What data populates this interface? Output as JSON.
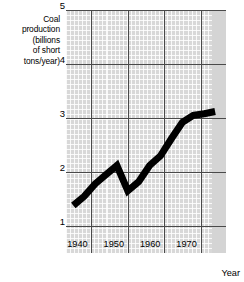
{
  "chart_data": {
    "type": "line",
    "title": "",
    "ylabel": "Coal production (billions of short tons/year)",
    "ylabel_lines": [
      "Coal",
      "production",
      "(billions",
      "of short",
      "tons/year)"
    ],
    "xlabel": "Year",
    "xlim": [
      1933,
      1977
    ],
    "ylim": [
      0.5,
      5.0
    ],
    "yticks": [
      5,
      4,
      3,
      2,
      1
    ],
    "ytick_labels": [
      "5",
      "4",
      "3",
      "2",
      "1"
    ],
    "xticks": [
      1940,
      1950,
      1960,
      1970
    ],
    "xtick_labels": [
      "1940",
      "1950",
      "1960",
      "1970"
    ],
    "grid": true,
    "grid_minor": true,
    "legend": "none",
    "line_color": "#000000",
    "grid_color": "#4a4a4a",
    "background_color": "#d8d8d8",
    "x": [
      1935,
      1938,
      1941,
      1944,
      1947,
      1950,
      1953,
      1956,
      1959,
      1962,
      1965,
      1968,
      1971,
      1974
    ],
    "values": [
      1.38,
      1.55,
      1.78,
      1.95,
      2.12,
      1.65,
      1.82,
      2.12,
      2.3,
      2.62,
      2.92,
      3.05,
      3.08,
      3.12
    ]
  }
}
